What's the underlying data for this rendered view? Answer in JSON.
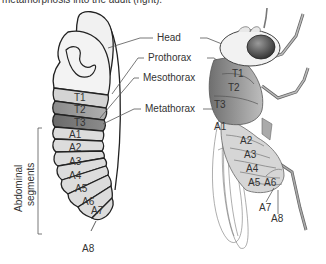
{
  "caption": "metamorphosis into the adult (right).",
  "larva": {
    "thorax_segments": [
      "T1",
      "T2",
      "T3"
    ],
    "abdominal_segments": [
      "A1",
      "A2",
      "A3",
      "A4",
      "A5",
      "A6",
      "A7",
      "A8"
    ],
    "abdominal_label_line1": "Abdominal",
    "abdominal_label_line2": "segments"
  },
  "callouts": {
    "head": "Head",
    "prothorax": "Prothorax",
    "mesothorax": "Mesothorax",
    "metathorax": "Metathorax"
  },
  "adult": {
    "thorax_segments": [
      "T1",
      "T2",
      "T3"
    ],
    "abdominal_segments": [
      "A1",
      "A2",
      "A3",
      "A4",
      "A5",
      "A6",
      "A7",
      "A8"
    ]
  },
  "colors": {
    "head": "#efefef",
    "t1": "#d2d2d2",
    "t2": "#9a9a9a",
    "t3": "#7c7c7c",
    "abdomen": "#dcdcdc",
    "outline": "#222222",
    "eye": "#4a4a4a"
  }
}
